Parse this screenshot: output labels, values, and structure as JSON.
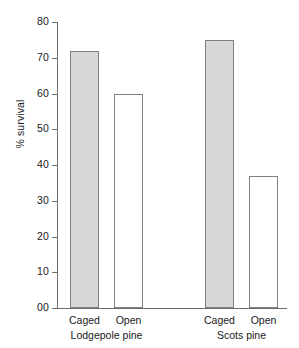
{
  "chart_data": {
    "type": "bar",
    "title": "",
    "xlabel": "",
    "ylabel": "% survival",
    "ylim": [
      0,
      80
    ],
    "ytick_labels": [
      "80",
      "70",
      "60",
      "50",
      "40",
      "30",
      "20",
      "10",
      "00"
    ],
    "ytick_values": [
      80,
      70,
      60,
      50,
      40,
      30,
      20,
      10,
      0
    ],
    "grid": false,
    "legend": "none",
    "categories": [
      "Caged",
      "Open",
      "Caged",
      "Open"
    ],
    "values": [
      72,
      60,
      75,
      37
    ],
    "groups": [
      {
        "label": "Lodgepole pine",
        "bars": [
          {
            "label": "Caged",
            "value": 72,
            "style": "filled"
          },
          {
            "label": "Open",
            "value": 60,
            "style": "open"
          }
        ]
      },
      {
        "label": "Scots pine",
        "bars": [
          {
            "label": "Caged",
            "value": 75,
            "style": "filled"
          },
          {
            "label": "Open",
            "value": 37,
            "style": "open"
          }
        ]
      }
    ],
    "colors": {
      "filled_bar": "#d8d8d8",
      "open_bar": "#ffffff",
      "bar_outline": "#808080",
      "axis": "#6e6e6e",
      "text": "#1a1a1a",
      "background": "#ffffff"
    }
  }
}
